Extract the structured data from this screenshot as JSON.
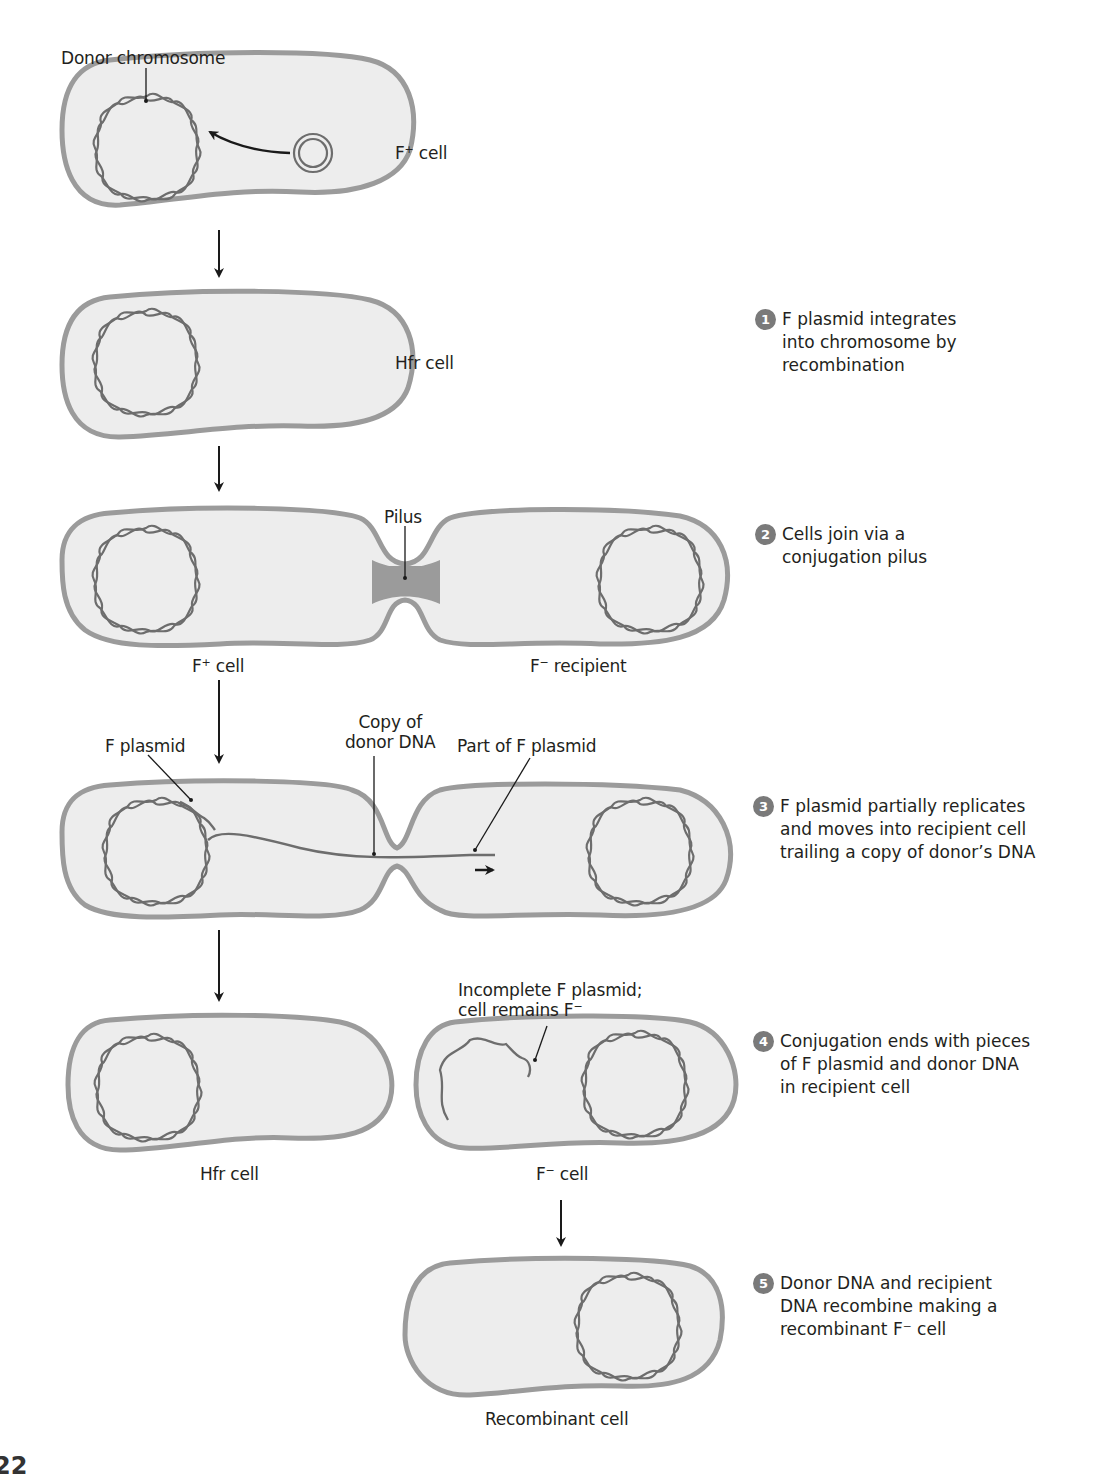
{
  "colors": {
    "cell_fill": "#ededed",
    "cell_wall": "#9b9b9b",
    "dna": "#6d6d6d",
    "arrow": "#1a1a1a",
    "badge": "#7a7a7a"
  },
  "labels": {
    "donor_chromosome": "Donor chromosome",
    "f_plus_cell_top": "F",
    "f_plus_cell_top_sup": "+",
    "f_plus_cell_top_suffix": " cell",
    "hfr_cell_1": "Hfr cell",
    "pilus": "Pilus",
    "f_plus_cell_2": "F",
    "f_plus_cell_2_sup": "+",
    "f_plus_cell_2_suffix": " cell",
    "f_minus_recipient": "F",
    "f_minus_recipient_sup": "−",
    "f_minus_recipient_suffix": " recipient",
    "f_plasmid": "F plasmid",
    "copy_of_donor_dna_1": "Copy of",
    "copy_of_donor_dna_2": "donor DNA",
    "part_of_f_plasmid": "Part of F plasmid",
    "incomplete_1": "Incomplete F plasmid;",
    "incomplete_2": "cell remains F",
    "incomplete_2_sup": "−",
    "hfr_cell_2": "Hfr cell",
    "f_minus_cell": "F",
    "f_minus_cell_sup": "−",
    "f_minus_cell_suffix": " cell",
    "recombinant_cell": "Recombinant cell"
  },
  "steps": [
    {
      "number": "1",
      "text": "F plasmid integrates\ninto chromosome by\nrecombination"
    },
    {
      "number": "2",
      "text": "Cells join via a\nconjugation pilus"
    },
    {
      "number": "3",
      "text": "F plasmid partially replicates\nand moves into recipient cell\ntrailing a copy of donor’s DNA"
    },
    {
      "number": "4",
      "text": "Conjugation ends with pieces\nof F plasmid and donor DNA\nin recipient cell"
    },
    {
      "number": "5",
      "text": "Donor DNA and recipient\nDNA recombine making a\nrecombinant F⁻ cell"
    }
  ],
  "page_number": "22"
}
